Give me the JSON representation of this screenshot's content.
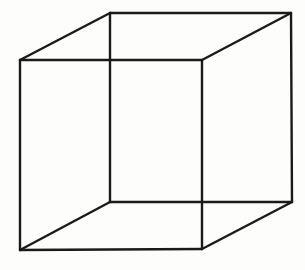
{
  "figure": {
    "stroke_color": "#1a1a1a",
    "background_color": "#fdfdfc",
    "vertices": {
      "front_top_left": [
        20,
        60
      ],
      "front_top_right": [
        202,
        60
      ],
      "front_bottom_left": [
        20,
        250
      ],
      "front_bottom_right": [
        202,
        249
      ],
      "back_top_left": [
        110,
        13
      ],
      "back_top_right": [
        291,
        13
      ],
      "back_bottom_left": [
        110,
        202
      ],
      "back_bottom_right": [
        292,
        202
      ]
    },
    "edges": [
      {
        "name": "front-top-edge",
        "from": "front_top_left",
        "to": "front_top_right"
      },
      {
        "name": "front-bottom-edge",
        "from": "front_bottom_left",
        "to": "front_bottom_right"
      },
      {
        "name": "front-left-edge",
        "from": "front_top_left",
        "to": "front_bottom_left"
      },
      {
        "name": "front-right-edge",
        "from": "front_top_right",
        "to": "front_bottom_right"
      },
      {
        "name": "back-top-edge",
        "from": "back_top_left",
        "to": "back_top_right"
      },
      {
        "name": "back-bottom-edge",
        "from": "back_bottom_left",
        "to": "back_bottom_right"
      },
      {
        "name": "back-left-edge",
        "from": "back_top_left",
        "to": "back_bottom_left"
      },
      {
        "name": "back-right-edge",
        "from": "back_top_right",
        "to": "back_bottom_right"
      },
      {
        "name": "connector-top-left-edge",
        "from": "front_top_left",
        "to": "back_top_left"
      },
      {
        "name": "connector-top-right-edge",
        "from": "front_top_right",
        "to": "back_top_right"
      },
      {
        "name": "connector-bottom-left-edge",
        "from": "front_bottom_left",
        "to": "back_bottom_left"
      },
      {
        "name": "connector-bottom-right-edge",
        "from": "front_bottom_right",
        "to": "back_bottom_right"
      }
    ]
  }
}
